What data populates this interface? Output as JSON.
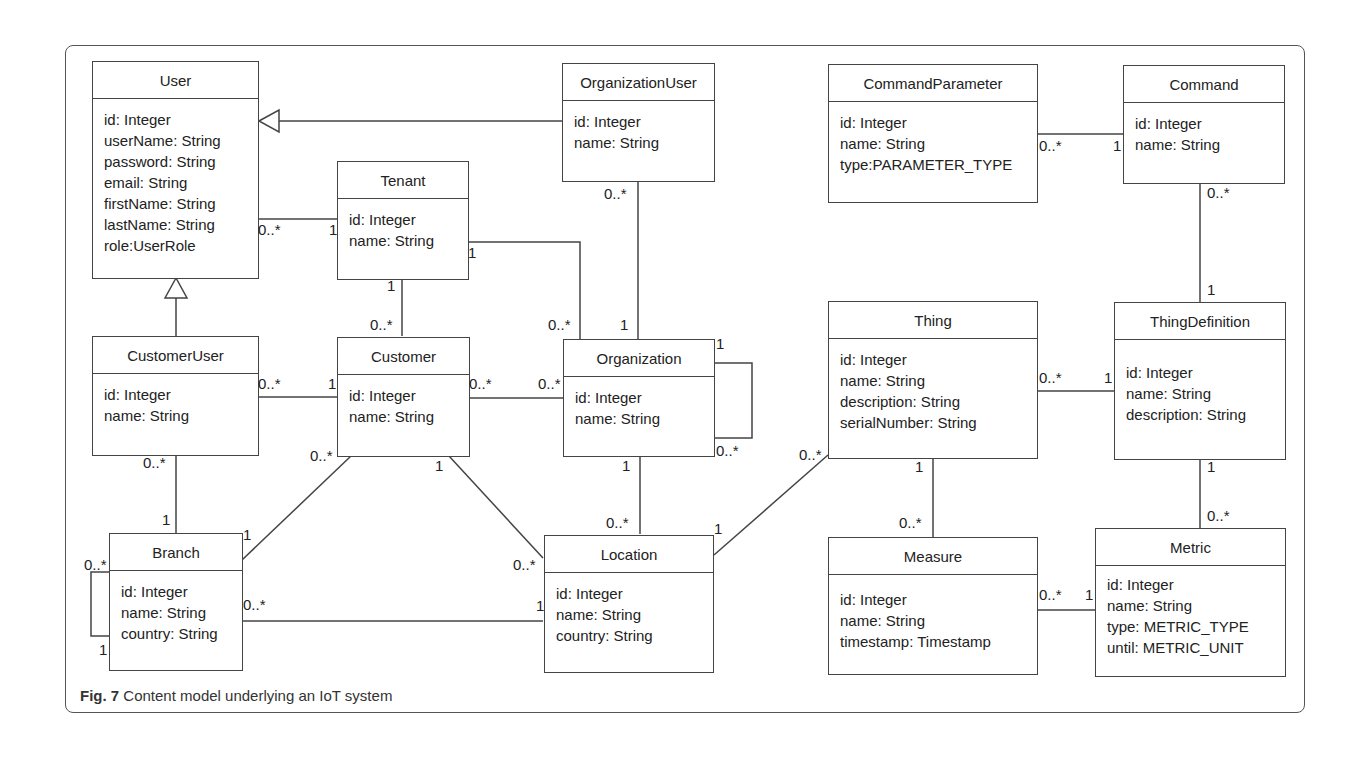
{
  "caption": {
    "label": "Fig. 7",
    "text": " Content model underlying an IoT system"
  },
  "classes": {
    "user": {
      "name": "User",
      "attrs": [
        "id: Integer",
        "userName: String",
        "password: String",
        "email: String",
        "firstName: String",
        "lastName: String",
        "role:UserRole"
      ]
    },
    "organization_user": {
      "name": "OrganizationUser",
      "attrs": [
        "id: Integer",
        "name: String"
      ]
    },
    "tenant": {
      "name": "Tenant",
      "attrs": [
        "id: Integer",
        "name: String"
      ]
    },
    "command_parameter": {
      "name": "CommandParameter",
      "attrs": [
        "id: Integer",
        "name: String",
        "type:PARAMETER_TYPE"
      ]
    },
    "command": {
      "name": "Command",
      "attrs": [
        "id: Integer",
        "name: String"
      ]
    },
    "customer_user": {
      "name": "CustomerUser",
      "attrs": [
        "id: Integer",
        "name: String"
      ]
    },
    "customer": {
      "name": "Customer",
      "attrs": [
        "id: Integer",
        "name: String"
      ]
    },
    "organization": {
      "name": "Organization",
      "attrs": [
        "id: Integer",
        "name: String"
      ]
    },
    "thing": {
      "name": "Thing",
      "attrs": [
        "id: Integer",
        "name: String",
        "description: String",
        "serialNumber: String"
      ]
    },
    "thing_definition": {
      "name": "ThingDefinition",
      "attrs": [
        "id: Integer",
        "name: String",
        "description: String"
      ]
    },
    "branch": {
      "name": "Branch",
      "attrs": [
        "id: Integer",
        "name: String",
        "country: String"
      ]
    },
    "location": {
      "name": "Location",
      "attrs": [
        "id: Integer",
        "name: String",
        "country: String"
      ]
    },
    "measure": {
      "name": "Measure",
      "attrs": [
        "id: Integer",
        "name: String",
        "timestamp: Timestamp"
      ]
    },
    "metric": {
      "name": "Metric",
      "attrs": [
        "id: Integer",
        "name: String",
        "type: METRIC_TYPE",
        "until: METRIC_UNIT"
      ]
    }
  },
  "multiplicities": [
    {
      "text": "0..*",
      "x": 258,
      "y": 222
    },
    {
      "text": "1",
      "x": 329,
      "y": 222
    },
    {
      "text": "1",
      "x": 468,
      "y": 245
    },
    {
      "text": "1",
      "x": 387,
      "y": 278
    },
    {
      "text": "0..*",
      "x": 370,
      "y": 317
    },
    {
      "text": "0..*",
      "x": 548,
      "y": 317
    },
    {
      "text": "1",
      "x": 620,
      "y": 317
    },
    {
      "text": "0..*",
      "x": 604,
      "y": 186
    },
    {
      "text": "0..*",
      "x": 258,
      "y": 376
    },
    {
      "text": "1",
      "x": 328,
      "y": 376
    },
    {
      "text": "0..*",
      "x": 469,
      "y": 376
    },
    {
      "text": "0..*",
      "x": 538,
      "y": 376
    },
    {
      "text": "1",
      "x": 716,
      "y": 336
    },
    {
      "text": "0..*",
      "x": 716,
      "y": 443
    },
    {
      "text": "0..*",
      "x": 143,
      "y": 455
    },
    {
      "text": "0..*",
      "x": 310,
      "y": 448
    },
    {
      "text": "1",
      "x": 435,
      "y": 458
    },
    {
      "text": "1",
      "x": 622,
      "y": 458
    },
    {
      "text": "1",
      "x": 162,
      "y": 512
    },
    {
      "text": "1",
      "x": 243,
      "y": 527
    },
    {
      "text": "0..*",
      "x": 84,
      "y": 557
    },
    {
      "text": "0..*",
      "x": 243,
      "y": 597
    },
    {
      "text": "1",
      "x": 99,
      "y": 642
    },
    {
      "text": "0..*",
      "x": 606,
      "y": 515
    },
    {
      "text": "0..*",
      "x": 513,
      "y": 557
    },
    {
      "text": "1",
      "x": 536,
      "y": 598
    },
    {
      "text": "1",
      "x": 714,
      "y": 521
    },
    {
      "text": "0..*",
      "x": 799,
      "y": 447
    },
    {
      "text": "0..*",
      "x": 1039,
      "y": 138
    },
    {
      "text": "1",
      "x": 1113,
      "y": 138
    },
    {
      "text": "0..*",
      "x": 1207,
      "y": 185
    },
    {
      "text": "1",
      "x": 1207,
      "y": 282
    },
    {
      "text": "0..*",
      "x": 1039,
      "y": 370
    },
    {
      "text": "1",
      "x": 1104,
      "y": 370
    },
    {
      "text": "1",
      "x": 915,
      "y": 459
    },
    {
      "text": "0..*",
      "x": 899,
      "y": 515
    },
    {
      "text": "1",
      "x": 1207,
      "y": 459
    },
    {
      "text": "0..*",
      "x": 1207,
      "y": 508
    },
    {
      "text": "0..*",
      "x": 1039,
      "y": 587
    },
    {
      "text": "1",
      "x": 1085,
      "y": 587
    }
  ]
}
